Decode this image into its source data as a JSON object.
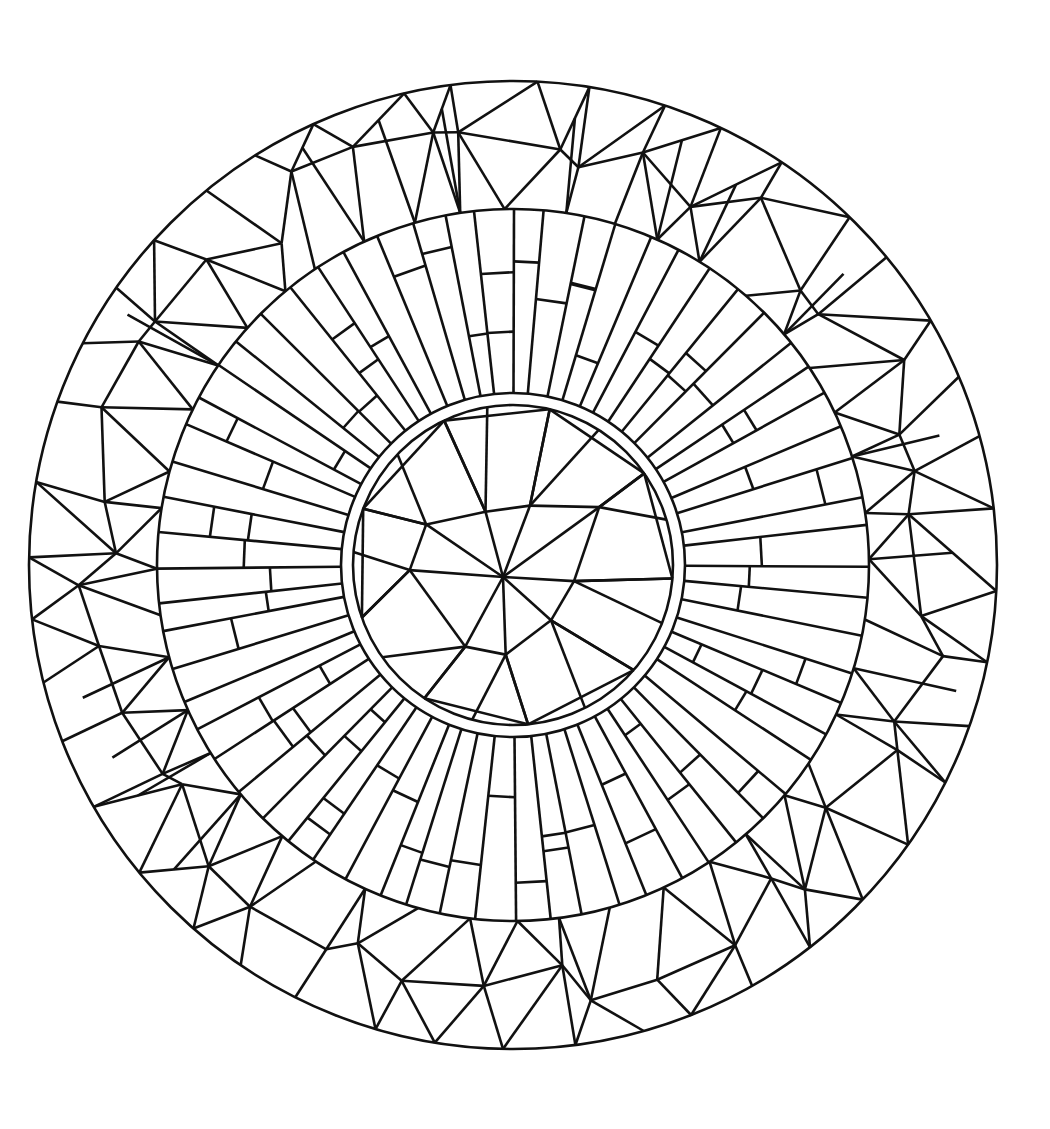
{
  "artwork": {
    "title": "",
    "kind": "mandala coloring page",
    "stroke_color": "#111111",
    "background_color": "#ffffff",
    "center": [
      513,
      565
    ],
    "outer_radius": 484,
    "rays_outer_radius": 356,
    "inner_ring_outer_radius": 172,
    "inner_ring_inner_radius": 160,
    "ray_count": 64,
    "rings": [
      "outer-polygon-ring",
      "radial-stripe-ring",
      "inner-double-circle",
      "triangulated-core"
    ]
  }
}
